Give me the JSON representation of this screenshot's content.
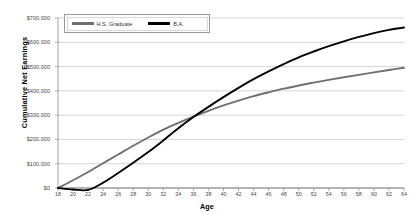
{
  "chart_data": {
    "type": "line",
    "title": "",
    "xlabel": "Age",
    "ylabel": "Cumulative Net Earnings",
    "xlim": [
      18,
      64
    ],
    "ylim": [
      0,
      700000
    ],
    "grid": true,
    "legend_position": "top-left",
    "y_ticks": [
      0,
      100000,
      200000,
      300000,
      400000,
      500000,
      600000,
      700000
    ],
    "y_tick_labels": [
      "$0",
      "$100,000",
      "$200,000",
      "$300,000",
      "$400,000",
      "$500,000",
      "$600,000",
      "$700,000"
    ],
    "x_ticks": [
      18,
      20,
      22,
      24,
      26,
      28,
      30,
      32,
      34,
      36,
      38,
      40,
      42,
      44,
      46,
      48,
      50,
      52,
      54,
      56,
      58,
      60,
      62,
      64
    ],
    "x_tick_labels": [
      "18",
      "20",
      "22",
      "24",
      "26",
      "28",
      "30",
      "32",
      "34",
      "36",
      "38",
      "40",
      "42",
      "44",
      "46",
      "48",
      "50",
      "52",
      "54",
      "56",
      "58",
      "60",
      "62",
      "64"
    ],
    "x": [
      18,
      20,
      22,
      24,
      26,
      28,
      30,
      32,
      34,
      36,
      38,
      40,
      42,
      44,
      46,
      48,
      50,
      52,
      54,
      56,
      58,
      60,
      62,
      64
    ],
    "series": [
      {
        "name": "H.S. Graduate",
        "color": "#6f6f6f",
        "values": [
          0,
          32000,
          66000,
          102000,
          138000,
          174000,
          208000,
          240000,
          268000,
          294000,
          318000,
          340000,
          360000,
          378000,
          394000,
          409000,
          422000,
          434000,
          445000,
          456000,
          466000,
          476000,
          486000,
          495000
        ]
      },
      {
        "name": "B.A.",
        "color": "#000000",
        "values": [
          0,
          -6000,
          -8000,
          22000,
          62000,
          104000,
          148000,
          196000,
          246000,
          292000,
          334000,
          374000,
          412000,
          448000,
          480000,
          510000,
          538000,
          562000,
          584000,
          604000,
          622000,
          638000,
          651000,
          661000
        ]
      }
    ]
  },
  "legend": {
    "items": [
      {
        "label": "H.S. Graduate",
        "color": "#6f6f6f"
      },
      {
        "label": "B.A.",
        "color": "#000000"
      }
    ]
  },
  "axes": {
    "x_title": "Age",
    "y_title": "Cumulative Net Earnings"
  },
  "colors": {
    "grid": "#b8b8b8",
    "axis": "#8a8a8a",
    "text": "#4a4a4a",
    "background": "#ffffff"
  }
}
